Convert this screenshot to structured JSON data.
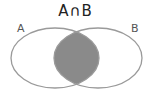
{
  "diagram": {
    "title": "A∩B",
    "sets": [
      {
        "label": "A",
        "cx": 55,
        "cy": 58,
        "rx": 44,
        "ry": 30
      },
      {
        "label": "B",
        "cx": 98,
        "cy": 58,
        "rx": 44,
        "ry": 30
      }
    ],
    "highlight": "intersection",
    "colors": {
      "stroke": "#9a9a9a",
      "fill": "#8a8a8a",
      "background": "#ffffff"
    }
  }
}
